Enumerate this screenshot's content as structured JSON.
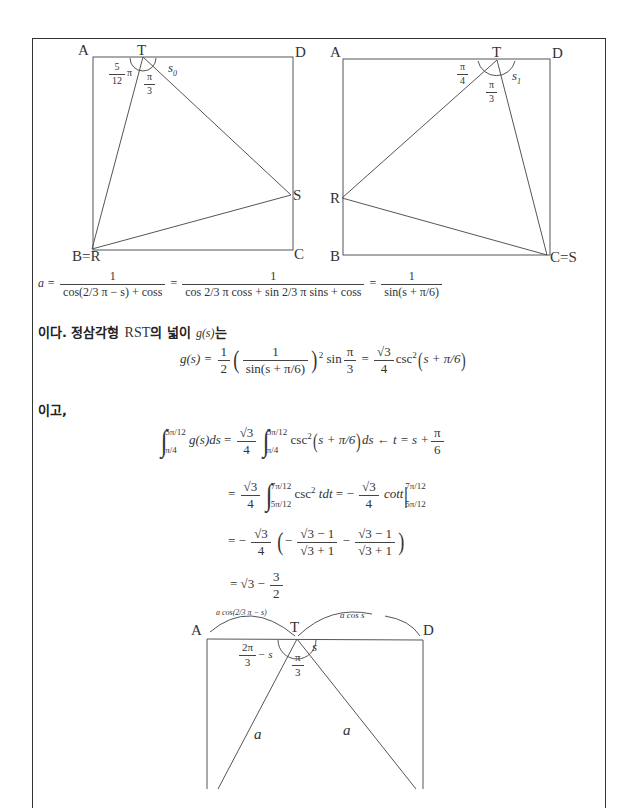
{
  "figure1": {
    "vertices": {
      "A": "A",
      "T": "T",
      "D": "D",
      "S": "S",
      "BR": "B=R",
      "C": "C"
    },
    "angles": {
      "left_num": "5",
      "left_den": "12",
      "left_pi": "π",
      "mid_num": "π",
      "mid_den": "3",
      "right": "s",
      "right_sub": "0"
    }
  },
  "figure2": {
    "vertices": {
      "A": "A",
      "T": "T",
      "D": "D",
      "R": "R",
      "B": "B",
      "CS": "C=S"
    },
    "angles": {
      "left_num": "π",
      "left_den": "4",
      "mid_num": "π",
      "mid_den": "3",
      "right": "s",
      "right_sub": "1"
    }
  },
  "eq_a": {
    "lhs": "a =",
    "term1_num": "1",
    "term1_den": "cos(2/3 π − s) + coss",
    "eq": "=",
    "term2_num": "1",
    "term2_den": "cos 2/3 π coss + sin 2/3 π sins + coss",
    "term3_num": "1",
    "term3_den": "sin(s + π/6)"
  },
  "text1": {
    "part1": "이다. 정삼각형",
    "rst": "RST",
    "part2": "의 넓이",
    "g": "g(s)",
    "part3": "는"
  },
  "eq_g": {
    "lhs": "g(s) =",
    "half_num": "1",
    "half_den": "2",
    "inner_num": "1",
    "inner_den": "sin(s + π/6)",
    "sq": "2",
    "sin": "sin",
    "pi3_num": "π",
    "pi3_den": "3",
    "eq": "=",
    "coef_num": "√3",
    "coef_den": "4",
    "csc": "csc",
    "arg": "s + π/6"
  },
  "text2": "이고,",
  "integral": {
    "line1": {
      "upper": "5π/12",
      "lower": "π/4",
      "integrand": "g(s)ds",
      "eq": "=",
      "coef_num": "√3",
      "coef_den": "4",
      "upper2": "5π/12",
      "lower2": "π/4",
      "body": "csc",
      "sq": "2",
      "arg": "s + π/6",
      "ds": "ds",
      "arrow": "←",
      "subst": "t = s +",
      "subst_num": "π",
      "subst_den": "6"
    },
    "line2": {
      "eq": "=",
      "coef_num": "√3",
      "coef_den": "4",
      "upper": "7π/12",
      "lower": "5π/12",
      "body": "csc",
      "sq": "2",
      "tdt": "tdt",
      "eq2": "= −",
      "coef2_num": "√3",
      "coef2_den": "4",
      "cot": "cott",
      "eval_upper": "7π/12",
      "eval_lower": "5π/12"
    },
    "line3": {
      "eq": "= −",
      "coef_num": "√3",
      "coef_den": "4",
      "f1_num": "√3 − 1",
      "f1_den": "√3 + 1",
      "f2_num": "√3 − 1",
      "f2_den": "√3 + 1",
      "minus": "−"
    },
    "line4": {
      "eq": "= √3 −",
      "num": "3",
      "den": "2"
    }
  },
  "figure3": {
    "vertices": {
      "A": "A",
      "T": "T",
      "D": "D"
    },
    "top_left_label": "a cos(2/3 π − s)",
    "top_right_label": "a cos s",
    "angle_left_num": "2π",
    "angle_left_den": "3",
    "angle_left_suffix": "− s",
    "angle_mid_num": "π",
    "angle_mid_den": "3",
    "angle_right": "s",
    "side_left": "a",
    "side_right": "a"
  }
}
